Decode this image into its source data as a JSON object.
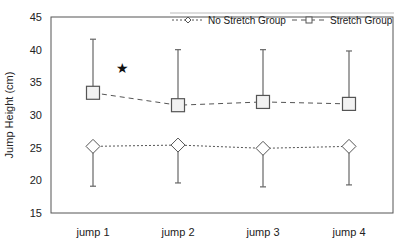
{
  "chart_data": {
    "type": "line",
    "title": "",
    "xlabel": "",
    "ylabel": "Jump Height (cm)",
    "ylim": [
      15,
      45
    ],
    "yticks": [
      15,
      20,
      25,
      30,
      35,
      40,
      45
    ],
    "categories": [
      "jump 1",
      "jump 2",
      "jump 3",
      "jump 4"
    ],
    "grid": false,
    "legend_position": "top-right",
    "series": [
      {
        "name": "No Stretch Group",
        "marker": "diamond",
        "line_style": "dotted",
        "values": [
          25.2,
          25.4,
          24.9,
          25.2
        ],
        "error_lower": [
          19.1,
          19.6,
          19.0,
          19.3
        ]
      },
      {
        "name": "Stretch Group",
        "marker": "square",
        "line_style": "dashed",
        "values": [
          33.4,
          31.5,
          32.0,
          31.7
        ],
        "error_upper": [
          41.6,
          40.0,
          40.0,
          39.8
        ]
      }
    ],
    "annotations": [
      {
        "text": "★",
        "category": "jump 1",
        "y": 37.2,
        "meaning": "significance marker"
      }
    ]
  },
  "labels": {
    "y_axis_title": "Jump Height (cm)",
    "legend_no_stretch": "No Stretch Group",
    "legend_stretch": "Stretch Group",
    "star": "★"
  },
  "colors": {
    "axis": "#555555",
    "line": "#555555",
    "marker_fill": "#f2f2f2",
    "text": "#222222"
  }
}
